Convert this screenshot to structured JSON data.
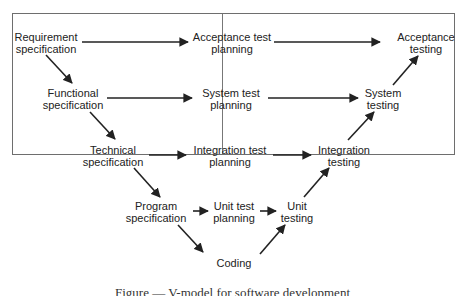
{
  "diagram": {
    "title": "V-model",
    "nodes": {
      "requirement_spec": {
        "line1": "Requirement",
        "line2": "specification"
      },
      "functional_spec": {
        "line1": "Functional",
        "line2": "specification"
      },
      "technical_spec": {
        "line1": "Technical",
        "line2": "specification"
      },
      "program_spec": {
        "line1": "Program",
        "line2": "specification"
      },
      "coding": {
        "line1": "Coding"
      },
      "acceptance_test_planning": {
        "line1": "Acceptance test",
        "line2": "planning"
      },
      "system_test_planning": {
        "line1": "System test",
        "line2": "planning"
      },
      "integration_test_planning": {
        "line1": "Integration test",
        "line2": "planning"
      },
      "unit_test_planning": {
        "line1": "Unit test",
        "line2": "planning"
      },
      "unit_testing": {
        "line1": "Unit",
        "line2": "testing"
      },
      "integration_testing": {
        "line1": "Integration",
        "line2": "testing"
      },
      "system_testing": {
        "line1": "System",
        "line2": "testing"
      },
      "acceptance_testing": {
        "line1": "Acceptance",
        "line2": "testing"
      }
    },
    "edges": [
      [
        "Requirement specification",
        "Acceptance test planning"
      ],
      [
        "Acceptance test planning",
        "Acceptance testing"
      ],
      [
        "Requirement specification",
        "Functional specification"
      ],
      [
        "Functional specification",
        "System test planning"
      ],
      [
        "System test planning",
        "System testing"
      ],
      [
        "Functional specification",
        "Technical specification"
      ],
      [
        "Technical specification",
        "Integration test planning"
      ],
      [
        "Integration test planning",
        "Integration testing"
      ],
      [
        "Technical specification",
        "Program specification"
      ],
      [
        "Program specification",
        "Unit test planning"
      ],
      [
        "Unit test planning",
        "Unit testing"
      ],
      [
        "Program specification",
        "Coding"
      ],
      [
        "Coding",
        "Unit testing"
      ],
      [
        "Unit testing",
        "Integration testing"
      ],
      [
        "Integration testing",
        "System testing"
      ],
      [
        "System testing",
        "Acceptance testing"
      ]
    ],
    "caption": "Figure — V-model for software development"
  }
}
